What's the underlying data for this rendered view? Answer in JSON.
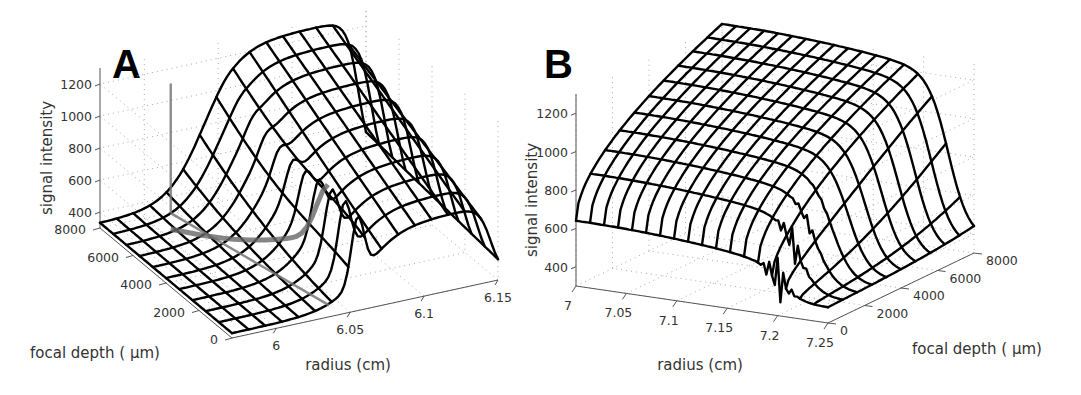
{
  "figure": {
    "panels": [
      {
        "id": "A",
        "letter": "A"
      },
      {
        "id": "B",
        "letter": "B"
      }
    ]
  },
  "chart_data": [
    {
      "panel": "A",
      "type": "surface3d",
      "title": "",
      "xlabel": "radius (cm)",
      "ylabel": "focal depth ( µm)",
      "zlabel": "signal intensity",
      "xlim": [
        5.97,
        6.15
      ],
      "ylim": [
        0,
        8000
      ],
      "zlim": [
        300,
        1300
      ],
      "x_ticks": [
        6,
        6.05,
        6.1,
        6.15
      ],
      "x_tick_labels": [
        "6",
        "6.05",
        "6.1",
        "6.15"
      ],
      "y_ticks": [
        0,
        2000,
        4000,
        6000,
        8000
      ],
      "y_tick_labels": [
        "0",
        "2000",
        "4000",
        "6000",
        "8000"
      ],
      "z_ticks": [
        400,
        600,
        800,
        1000,
        1200
      ],
      "z_tick_labels": [
        "400",
        "600",
        "800",
        "1000",
        "1200"
      ],
      "grid": true,
      "description": "Wireframe mesh: intensity rises from ~320 at low radius to a plateau ~1250 near r=6.1 cm, then falls off at r=6.15; a narrow peak near r=6.05 at low focal depth; gray overlay traces mark a boundary.",
      "surface_profile": {
        "radius": [
          5.97,
          5.99,
          6.01,
          6.03,
          6.05,
          6.07,
          6.09,
          6.11,
          6.13,
          6.15
        ],
        "intensity_at_max_depth": [
          320,
          360,
          450,
          620,
          850,
          1050,
          1200,
          1250,
          1150,
          700
        ],
        "intensity_at_min_depth": [
          320,
          330,
          360,
          420,
          760,
          500,
          430,
          400,
          380,
          340
        ]
      }
    },
    {
      "panel": "B",
      "type": "surface3d",
      "title": "",
      "xlabel": "radius (cm)",
      "ylabel": "focal depth ( µm)",
      "zlabel": "signal intensity",
      "xlim": [
        7.0,
        7.25
      ],
      "ylim": [
        0,
        8000
      ],
      "zlim": [
        300,
        1300
      ],
      "x_ticks": [
        7,
        7.05,
        7.1,
        7.15,
        7.2,
        7.25
      ],
      "x_tick_labels": [
        "7",
        "7.05",
        "7.1",
        "7.15",
        "7.2",
        "7.25"
      ],
      "y_ticks": [
        0,
        2000,
        4000,
        6000,
        8000
      ],
      "y_tick_labels": [
        "0",
        "2000",
        "4000",
        "6000",
        "8000"
      ],
      "z_ticks": [
        400,
        600,
        800,
        1000,
        1200
      ],
      "z_tick_labels": [
        "400",
        "600",
        "800",
        "1000",
        "1200"
      ],
      "grid": true,
      "description": "Wireframe mesh: high plateau (~1200-1300) at small radius and large depth, falling sharply near r=7.2 cm to ~400; small oscillatory peak near r=7.2 at low depth.",
      "surface_profile": {
        "radius": [
          7.0,
          7.05,
          7.1,
          7.15,
          7.2,
          7.25
        ],
        "intensity_at_max_depth": [
          1300,
          1300,
          1280,
          1200,
          900,
          400
        ],
        "intensity_at_min_depth": [
          650,
          640,
          620,
          560,
          480,
          380
        ]
      }
    }
  ]
}
